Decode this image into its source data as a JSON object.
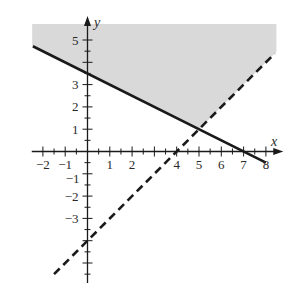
{
  "chart_data": {
    "type": "line",
    "title": "",
    "xlabel": "x",
    "ylabel": "y",
    "xlim": [
      -2.5,
      8.5
    ],
    "ylim": [
      -5.8,
      5.7
    ],
    "grid": false,
    "x_ticks_labeled": [
      "-2",
      "-1",
      "1",
      "2",
      "4",
      "5",
      "6",
      "7",
      "8"
    ],
    "y_ticks_labeled": [
      "5",
      "3",
      "2",
      "1",
      "-1",
      "-2",
      "-3"
    ],
    "minor_tick_step": 0.5,
    "series": [
      {
        "name": "boundary-solid",
        "style": "solid",
        "equation": "y = -x/2 + 3.5",
        "points": [
          [
            -2.45,
            4.72
          ],
          [
            8.0,
            -0.5
          ]
        ]
      },
      {
        "name": "boundary-dashed",
        "style": "dashed",
        "equation": "y = x - 4",
        "points": [
          [
            -1.5,
            -5.5
          ],
          [
            8.4,
            4.4
          ]
        ]
      }
    ],
    "shaded_region": {
      "description": "region above solid line and above dashed line",
      "inequalities": [
        "y >= -x/2 + 3.5",
        "y > x - 4"
      ],
      "color": "#d9d9d9",
      "vertices": [
        [
          -2.48,
          5.72
        ],
        [
          8.47,
          5.72
        ],
        [
          8.47,
          4.47
        ],
        [
          5,
          1
        ],
        [
          -2.48,
          4.74
        ]
      ]
    },
    "intersection": [
      5,
      1
    ]
  },
  "labels": {
    "x_axis": "x",
    "y_axis": "y",
    "x_ticks": [
      {
        "v": -2,
        "t": "−2"
      },
      {
        "v": -1,
        "t": "−1"
      },
      {
        "v": 1,
        "t": "1"
      },
      {
        "v": 2,
        "t": "2"
      },
      {
        "v": 4,
        "t": "4"
      },
      {
        "v": 5,
        "t": "5"
      },
      {
        "v": 6,
        "t": "6"
      },
      {
        "v": 7,
        "t": "7"
      },
      {
        "v": 8,
        "t": "8"
      }
    ],
    "y_ticks": [
      {
        "v": 5,
        "t": "5"
      },
      {
        "v": 3,
        "t": "3"
      },
      {
        "v": 2,
        "t": "2"
      },
      {
        "v": 1,
        "t": "1"
      },
      {
        "v": -1,
        "t": "−1"
      },
      {
        "v": -2,
        "t": "−2"
      },
      {
        "v": -3,
        "t": "−3"
      }
    ]
  },
  "colors": {
    "ink": "#1a1a1a",
    "shade": "#d9d9d9"
  }
}
